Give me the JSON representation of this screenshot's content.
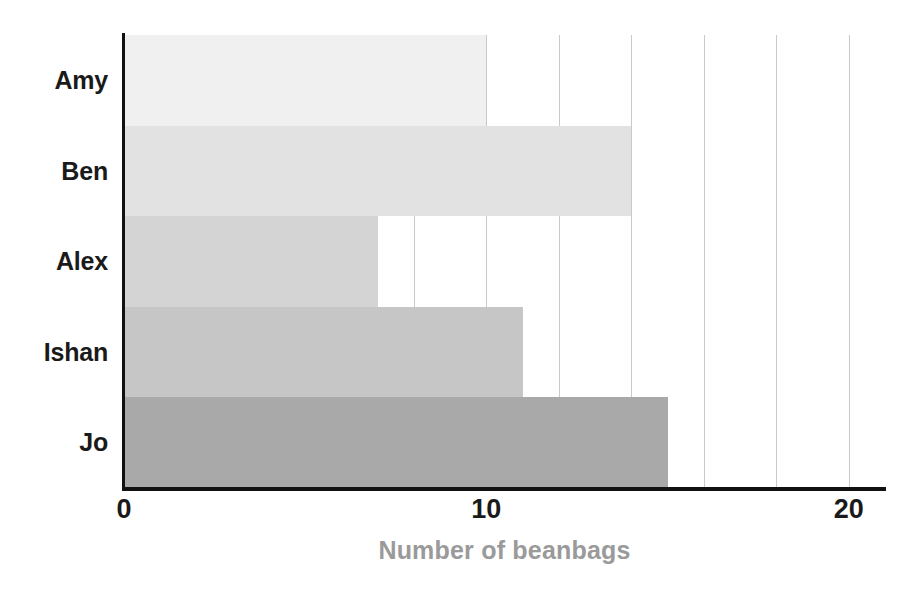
{
  "chart_data": {
    "type": "bar",
    "orientation": "horizontal",
    "title": "",
    "xlabel": "Number of beanbags",
    "ylabel": "",
    "categories": [
      "Amy",
      "Ben",
      "Alex",
      "Ishan",
      "Jo"
    ],
    "values": [
      10,
      14,
      7,
      11,
      15
    ],
    "series": [
      {
        "name": "Number of beanbags",
        "values": [
          10,
          14,
          7,
          11,
          15
        ]
      }
    ],
    "bar_colors": [
      "#f0f0f0",
      "#e2e2e2",
      "#d4d4d4",
      "#c6c6c6",
      "#a9a9a9"
    ],
    "xlim": [
      0,
      21
    ],
    "ylim": [
      0,
      5
    ],
    "x_ticks": [
      0,
      10,
      20
    ],
    "x_tick_labels": [
      "0",
      "10",
      "20"
    ],
    "gridlines": [
      0,
      2,
      4,
      6,
      8,
      10,
      12,
      14,
      16,
      18,
      20
    ],
    "grid": true,
    "grid_axis": "x",
    "grid_color": "#c9c9c9",
    "legend": "none",
    "axis_color": "#111111",
    "label_color": "#1a1a1a",
    "axis_title_color": "#9a9a9a",
    "background": "#ffffff"
  }
}
